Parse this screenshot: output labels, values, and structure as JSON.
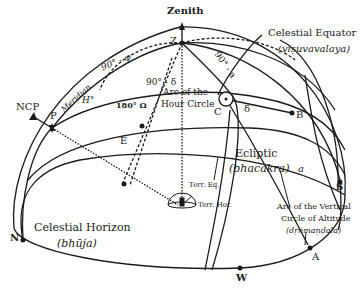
{
  "figure": {
    "type": "celestial-sphere-diagram",
    "points": {
      "zenith": "Zenith",
      "z": "Z",
      "ncp": "NCP",
      "p": "P",
      "e": "E",
      "c": "C",
      "b": "B",
      "n": "N",
      "s": "S",
      "w": "W",
      "a_point": "A"
    },
    "arcs": {
      "meridian": "Meridian",
      "ninety_minus_phi": "90° - φ",
      "ninety_minus_delta": "90° - δ",
      "ninety_minus_a": "90° - a",
      "h_angle": "H°",
      "delta": "δ",
      "a_arc": "a",
      "omega_label": "180° Ω"
    },
    "circles": {
      "celestial_equator": {
        "name": "Celestial Equator",
        "sanskrit": "(viṣuvavalaya)"
      },
      "hour_circle": {
        "line1": "Arc of the",
        "line2": "Hour Circle"
      },
      "ecliptic": {
        "name": "Ecliptic",
        "sanskrit": "(bhacakra)"
      },
      "celestial_horizon": {
        "name": "Celestial Horizon",
        "sanskrit": "(bhūja)"
      },
      "vertical_circle": {
        "line1": "Arc of the Vertical",
        "line2": "Circle of Altitude",
        "sanskrit": "(dṛṅmaṇḍala)"
      }
    },
    "observer": {
      "terr_eq": "Terr. Eq.",
      "terr_hor": "Terr. Hor."
    },
    "colors": {
      "line": "#1a1a1a",
      "background": "#ffffff"
    }
  }
}
